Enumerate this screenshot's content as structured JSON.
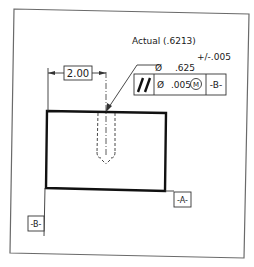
{
  "drawing": {
    "title_note": "Actual (.6213)",
    "tolerance": "+/-.005",
    "hole_diameter_symbol": "Ø",
    "hole_diameter_value": ".625",
    "location_dimension": "2.00",
    "feature_control_frame": {
      "characteristic_symbol": "//",
      "diameter_symbol": "Ø",
      "tolerance_value": ".005",
      "modifier": "M",
      "datum": "-B-"
    },
    "datum_a_label": "-A-",
    "datum_b_label": "-B-"
  },
  "colors": {
    "line": "#1a1a1a",
    "border": "#555555",
    "background": "#ffffff"
  }
}
